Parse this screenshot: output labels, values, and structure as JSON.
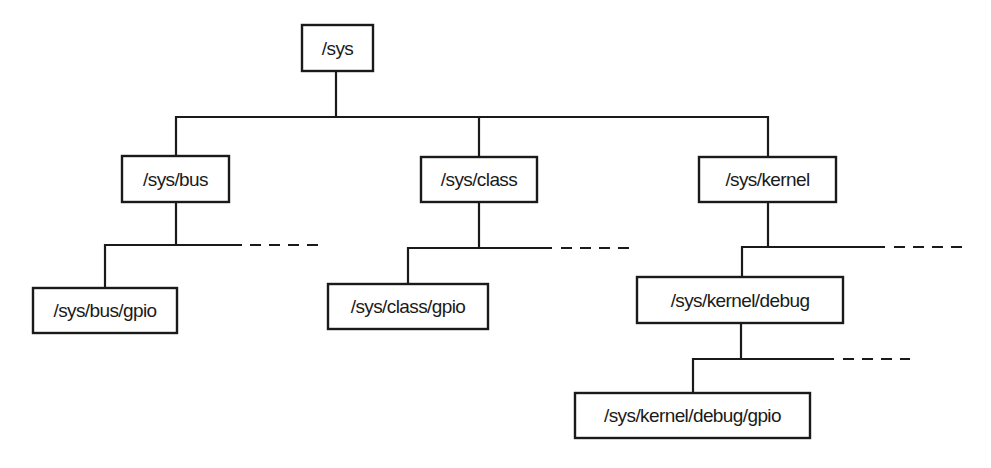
{
  "diagram": {
    "type": "tree",
    "nodes": [
      {
        "id": "sys",
        "label": "/sys",
        "parent": null,
        "box": [
          302,
          25,
          71,
          46
        ]
      },
      {
        "id": "sys-bus",
        "label": "/sys/bus",
        "parent": "sys",
        "box": [
          122,
          156,
          107,
          46
        ]
      },
      {
        "id": "sys-class",
        "label": "/sys/class",
        "parent": "sys",
        "box": [
          421,
          157,
          116,
          45
        ]
      },
      {
        "id": "sys-kernel",
        "label": "/sys/kernel",
        "parent": "sys",
        "box": [
          699,
          157,
          137,
          45
        ]
      },
      {
        "id": "sys-bus-gpio",
        "label": "/sys/bus/gpio",
        "parent": "sys-bus",
        "box": [
          33,
          288,
          144,
          45
        ]
      },
      {
        "id": "sys-class-gpio",
        "label": "/sys/class/gpio",
        "parent": "sys-class",
        "box": [
          328,
          284,
          160,
          45
        ]
      },
      {
        "id": "sys-kernel-debug",
        "label": "/sys/kernel/debug",
        "parent": "sys-kernel",
        "box": [
          637,
          277,
          206,
          46
        ]
      },
      {
        "id": "sys-kernel-debug-gpio",
        "label": "/sys/kernel/debug/gpio",
        "parent": "sys-kernel-debug",
        "box": [
          575,
          393,
          235,
          45
        ]
      }
    ],
    "continuations": [
      {
        "after": "sys-bus",
        "note": "more children (dashed)"
      },
      {
        "after": "sys-class",
        "note": "more children (dashed)"
      },
      {
        "after": "sys-kernel",
        "note": "more children (dashed)"
      },
      {
        "after": "sys-kernel-debug",
        "note": "more children (dashed)"
      }
    ],
    "colors": {
      "line": "#1a1a1a",
      "box_fill": "#ffffff",
      "text": "#1a1a1a",
      "background": "#ffffff"
    }
  }
}
